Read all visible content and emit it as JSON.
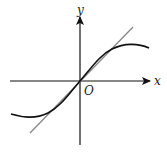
{
  "diagram": {
    "type": "function-graph",
    "axes": {
      "x_label": "x",
      "y_label": "y",
      "origin_label": "O"
    },
    "curve": {
      "name": "function-curve",
      "color": "#111111"
    },
    "tangent": {
      "name": "tangent-line",
      "color": "#888888"
    }
  }
}
